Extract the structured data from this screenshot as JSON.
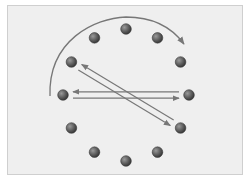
{
  "diagram": {
    "type": "clock-face-transitions",
    "node_count": 12,
    "node_color": "#5a5a5a",
    "arrow_color": "#777777",
    "background": "#efefef",
    "arcs": [
      {
        "name": "clockwise-arc",
        "from_clock": 9,
        "to_clock": 2,
        "direction": "clockwise"
      }
    ],
    "arrows": [
      {
        "from_clock": 9,
        "to_clock": 3
      },
      {
        "from_clock": 3,
        "to_clock": 9
      },
      {
        "from_clock": 10,
        "to_clock": 4
      },
      {
        "from_clock": 4,
        "to_clock": 10
      }
    ]
  }
}
